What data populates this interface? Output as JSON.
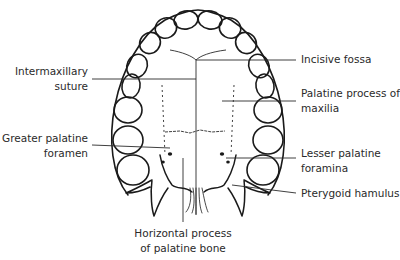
{
  "diagram": {
    "labels": {
      "intermaxillary_suture": {
        "line1": "Intermaxillary",
        "line2": "suture"
      },
      "incisive_fossa": {
        "line1": "Incisive fossa"
      },
      "palatine_process": {
        "line1": "Palatine process of",
        "line2": "maxilia"
      },
      "greater_palatine_foramen": {
        "line1": "Greater palatine",
        "line2": "foramen"
      },
      "lesser_palatine_foramina": {
        "line1": "Lesser palatine",
        "line2": "foramina"
      },
      "pterygoid_hamulus": {
        "line1": "Pterygoid hamulus"
      },
      "horizontal_process": {
        "line1": "Horizontal process",
        "line2": "of palatine bone"
      }
    },
    "colors": {
      "line": "#1a1a1a",
      "text": "#2a2a2a",
      "background": "#ffffff"
    }
  }
}
